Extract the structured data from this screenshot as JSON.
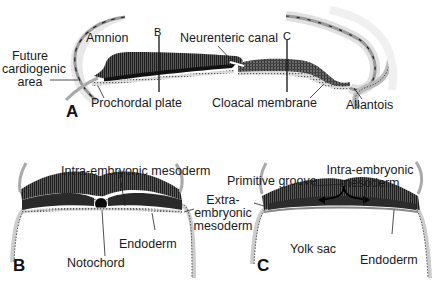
{
  "figure": {
    "panels": [
      {
        "id": "A",
        "letter": "A",
        "labels": {
          "amnion": "Amnion",
          "future_cardiogenic_area_1": "Future",
          "future_cardiogenic_area_2": "cardiogenic",
          "future_cardiogenic_area_3": "area",
          "prochordal_plate": "Prochordal plate",
          "neurenteric_canal": "Neurenteric canal",
          "cloacal_membrane": "Cloacal membrane",
          "allantois": "Allantois",
          "section_b": "B",
          "section_c": "C"
        }
      },
      {
        "id": "B",
        "letter": "B",
        "labels": {
          "intra_embryonic_mesoderm": "Intra-embryonic mesoderm",
          "notochord": "Notochord",
          "endoderm": "Endoderm"
        }
      },
      {
        "id": "C",
        "letter": "C",
        "labels": {
          "primitive_groove": "Primitive groove",
          "intra_embryonic_mesoderm_1": "Intra-embryonic",
          "intra_embryonic_mesoderm_2": "mesoderm",
          "extra_embryonic_mesoderm_1": "Extra-",
          "extra_embryonic_mesoderm_2": "embryonic",
          "extra_embryonic_mesoderm_3": "mesoderm",
          "yolk_sac": "Yolk sac",
          "endoderm": "Endoderm"
        }
      }
    ],
    "colors": {
      "ectoderm": "#3a3a3a",
      "mesoderm": "#2a2a2a",
      "endoderm": "#9a9a9a",
      "amnion_halo": "#e6e6e6",
      "text": "#1a1a1a"
    }
  }
}
